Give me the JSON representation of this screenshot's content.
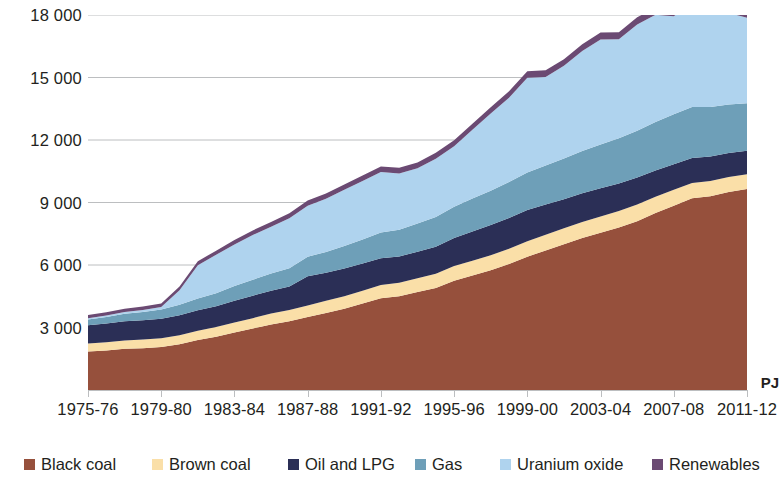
{
  "chart_data": {
    "type": "area",
    "stacked": true,
    "title": "",
    "subtitle": "",
    "xlabel": "",
    "ylabel": "PJ",
    "ylim": [
      0,
      18000
    ],
    "yticks": [
      0,
      3000,
      6000,
      9000,
      12000,
      15000,
      18000
    ],
    "ytick_labels": [
      "",
      "3 000",
      "6 000",
      "9 000",
      "12 000",
      "15 000",
      "18 000"
    ],
    "grid": "horizontal",
    "legend_position": "bottom",
    "x": [
      "1975-76",
      "1976-77",
      "1977-78",
      "1978-79",
      "1979-80",
      "1980-81",
      "1981-82",
      "1982-83",
      "1983-84",
      "1984-85",
      "1985-86",
      "1986-87",
      "1987-88",
      "1988-89",
      "1989-90",
      "1990-91",
      "1991-92",
      "1992-93",
      "1993-94",
      "1994-95",
      "1995-96",
      "1996-97",
      "1997-98",
      "1998-99",
      "1999-00",
      "2000-01",
      "2001-02",
      "2002-03",
      "2003-04",
      "2004-05",
      "2005-06",
      "2006-07",
      "2007-08",
      "2008-09",
      "2009-10",
      "2010-11",
      "2011-12"
    ],
    "xtick_labels": [
      "1975-76",
      "1979-80",
      "1983-84",
      "1987-88",
      "1991-92",
      "1995-96",
      "1999-00",
      "2003-04",
      "2007-08",
      "2011-12"
    ],
    "series": [
      {
        "name": "Black coal",
        "color": "#96503C",
        "values": [
          1850,
          1900,
          1980,
          2010,
          2060,
          2200,
          2400,
          2560,
          2760,
          2950,
          3150,
          3300,
          3500,
          3700,
          3900,
          4150,
          4400,
          4500,
          4700,
          4900,
          5250,
          5500,
          5750,
          6050,
          6400,
          6700,
          7000,
          7300,
          7550,
          7800,
          8100,
          8500,
          8850,
          9200,
          9300,
          9500,
          9650
        ]
      },
      {
        "name": "Brown coal",
        "color": "#FADFA8",
        "values": [
          380,
          390,
          400,
          410,
          420,
          430,
          450,
          460,
          480,
          500,
          520,
          540,
          560,
          580,
          600,
          620,
          640,
          650,
          660,
          680,
          700,
          710,
          720,
          730,
          740,
          750,
          760,
          770,
          780,
          790,
          800,
          780,
          760,
          740,
          730,
          720,
          710
        ]
      },
      {
        "name": "Oil and LPG",
        "color": "#2B2F56",
        "values": [
          880,
          900,
          920,
          930,
          940,
          960,
          980,
          1000,
          1050,
          1080,
          1100,
          1130,
          1400,
          1350,
          1330,
          1300,
          1280,
          1260,
          1280,
          1300,
          1350,
          1400,
          1450,
          1480,
          1500,
          1450,
          1400,
          1380,
          1350,
          1320,
          1300,
          1260,
          1230,
          1200,
          1180,
          1150,
          1130
        ]
      },
      {
        "name": "Gas",
        "color": "#6E9FB8",
        "values": [
          280,
          320,
          360,
          400,
          440,
          500,
          560,
          620,
          700,
          760,
          820,
          880,
          940,
          1000,
          1080,
          1160,
          1240,
          1280,
          1350,
          1420,
          1500,
          1580,
          1650,
          1720,
          1800,
          1880,
          1950,
          2020,
          2100,
          2180,
          2250,
          2320,
          2400,
          2450,
          2380,
          2330,
          2280
        ]
      },
      {
        "name": "Uranium oxide",
        "color": "#AFD3EE",
        "values": [
          60,
          70,
          80,
          90,
          120,
          700,
          1600,
          1850,
          2000,
          2150,
          2250,
          2400,
          2450,
          2550,
          2700,
          2800,
          2900,
          2700,
          2650,
          2800,
          2900,
          3300,
          3700,
          4050,
          4550,
          4250,
          4450,
          4800,
          5050,
          4750,
          5100,
          5150,
          4700,
          5050,
          4800,
          4400,
          4100
        ]
      },
      {
        "name": "Renewables",
        "color": "#6B4A73",
        "values": [
          150,
          155,
          160,
          165,
          170,
          180,
          190,
          200,
          210,
          220,
          230,
          240,
          250,
          255,
          260,
          265,
          270,
          275,
          280,
          285,
          290,
          295,
          300,
          305,
          310,
          315,
          320,
          325,
          330,
          335,
          340,
          345,
          350,
          355,
          360,
          365,
          370
        ]
      }
    ]
  },
  "axes": {
    "y_unit_label": "PJ"
  },
  "legend": {
    "items": [
      {
        "label": "Black coal",
        "color": "#96503C"
      },
      {
        "label": "Brown coal",
        "color": "#FADFA8"
      },
      {
        "label": "Oil and LPG",
        "color": "#2B2F56"
      },
      {
        "label": "Gas",
        "color": "#6E9FB8"
      },
      {
        "label": "Uranium oxide",
        "color": "#AFD3EE"
      },
      {
        "label": "Renewables",
        "color": "#6B4A73"
      }
    ]
  }
}
